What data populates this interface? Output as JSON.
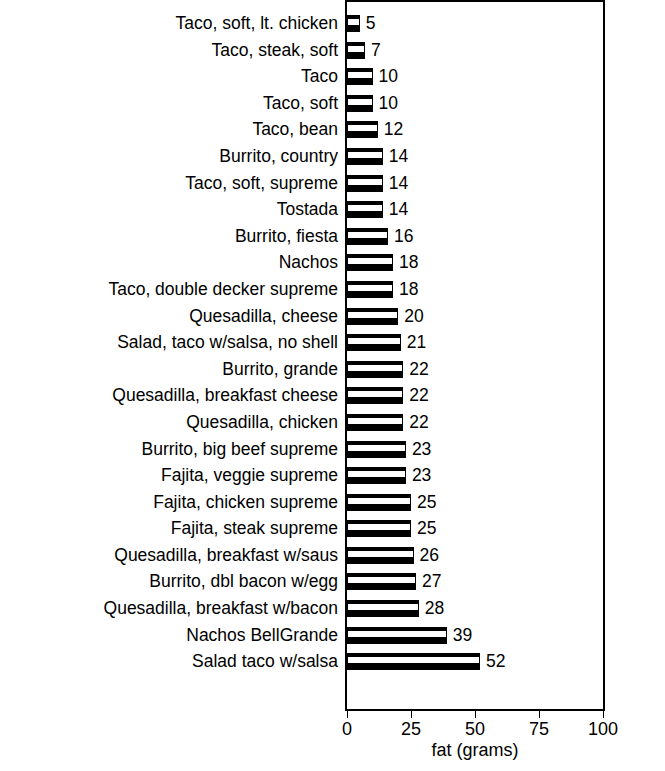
{
  "chart_data": {
    "type": "bar",
    "orientation": "horizontal",
    "title": "",
    "xlabel": "fat (grams)",
    "ylabel": "",
    "xlim": [
      0,
      100
    ],
    "xticks": [
      0,
      25,
      50,
      75,
      100
    ],
    "grid": false,
    "legend": null,
    "categories": [
      "Taco, soft, lt. chicken",
      "Taco, steak, soft",
      "Taco",
      "Taco, soft",
      "Taco, bean",
      "Burrito, country",
      "Taco, soft, supreme",
      "Tostada",
      "Burrito, fiesta",
      "Nachos",
      "Taco, double decker supreme",
      "Quesadilla, cheese",
      "Salad, taco w/salsa, no shell",
      "Burrito, grande",
      "Quesadilla, breakfast cheese",
      "Quesadilla, chicken",
      "Burrito, big beef supreme",
      "Fajita, veggie supreme",
      "Fajita, chicken supreme",
      "Fajita, steak supreme",
      "Quesadilla, breakfast w/saus",
      "Burrito, dbl bacon w/egg",
      "Quesadilla, breakfast w/bacon",
      "Nachos BellGrande",
      "Salad taco w/salsa"
    ],
    "values": [
      5,
      7,
      10,
      10,
      12,
      14,
      14,
      14,
      16,
      18,
      18,
      20,
      21,
      22,
      22,
      22,
      23,
      23,
      25,
      25,
      26,
      27,
      28,
      39,
      52
    ],
    "value_labels": [
      "5",
      "7",
      "10",
      "10",
      "12",
      "14",
      "14",
      "14",
      "16",
      "18",
      "18",
      "20",
      "21",
      "22",
      "22",
      "22",
      "23",
      "23",
      "25",
      "25",
      "26",
      "27",
      "28",
      "39",
      "52"
    ],
    "tick_labels": [
      "0",
      "25",
      "50",
      "75",
      "100"
    ],
    "bar_color": "#000000",
    "background_color": "#ffffff"
  }
}
